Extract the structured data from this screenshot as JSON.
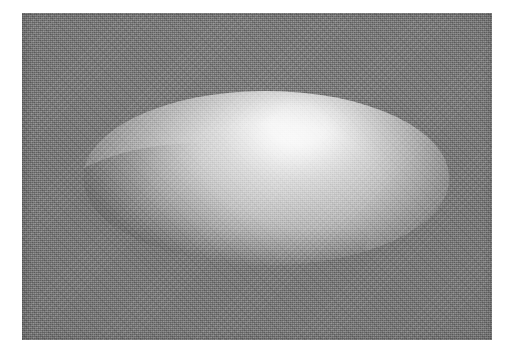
{
  "document": {
    "page_background": "#ffffff",
    "figure_caption": ""
  },
  "figure": {
    "kind": "raster-photograph",
    "plate": {
      "x": 22,
      "y": 13,
      "width": 470,
      "height": 327,
      "background_color": "#777777",
      "texture": "halftone-dither-grain"
    },
    "ellipsoid": {
      "center_x": 266,
      "center_y": 178,
      "radius_x": 183,
      "radius_y": 87,
      "highlight_color": "#f4f4f4",
      "midtone_color": "#cccccc",
      "shadow_color": "#9a9a9a",
      "terminator_color": "#8e8e8e",
      "light_direction": "upper-left",
      "highlight_x_percent": 59,
      "highlight_y_percent": 20,
      "shading_model": "diffuse-gouraud"
    }
  },
  "colors": {
    "page": "#ffffff",
    "plate_gray": "#777777",
    "ellipsoid_bright": "#f4f4f4",
    "ellipsoid_dark": "#9a9a9a"
  }
}
